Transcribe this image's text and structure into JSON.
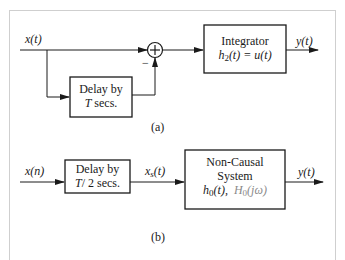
{
  "diagram_a": {
    "input_label": "x(t)",
    "delay_block": {
      "line1": "Delay by",
      "line2_var": "T",
      "line2_rest": " secs."
    },
    "summer": {
      "minus_sign": "−"
    },
    "integrator_block": {
      "title": "Integrator",
      "equation_lhs": "h",
      "equation_sub": "2",
      "equation_rest": "(t) = u(t)"
    },
    "output_label": "y(t)",
    "caption": "(a)"
  },
  "diagram_b": {
    "input_label": "x(n)",
    "delay_block": {
      "line1": "Delay by",
      "line2_var": "T",
      "line2_rest": "/ 2 secs."
    },
    "mid_label_base": "x",
    "mid_label_sub": "s",
    "mid_label_rest": "(t)",
    "system_block": {
      "line1": "Non-Causal",
      "line2": "System",
      "h_base": "h",
      "h_sub": "0",
      "h_rest": "(t),",
      "H_base": "H",
      "H_sub": "0",
      "H_rest": "(jω)"
    },
    "output_label": "y(t)",
    "caption": "(b)"
  },
  "colors": {
    "line": "#1a1a1a",
    "frame": "#cfcfcf",
    "muted_text": "#8a8a8a"
  }
}
